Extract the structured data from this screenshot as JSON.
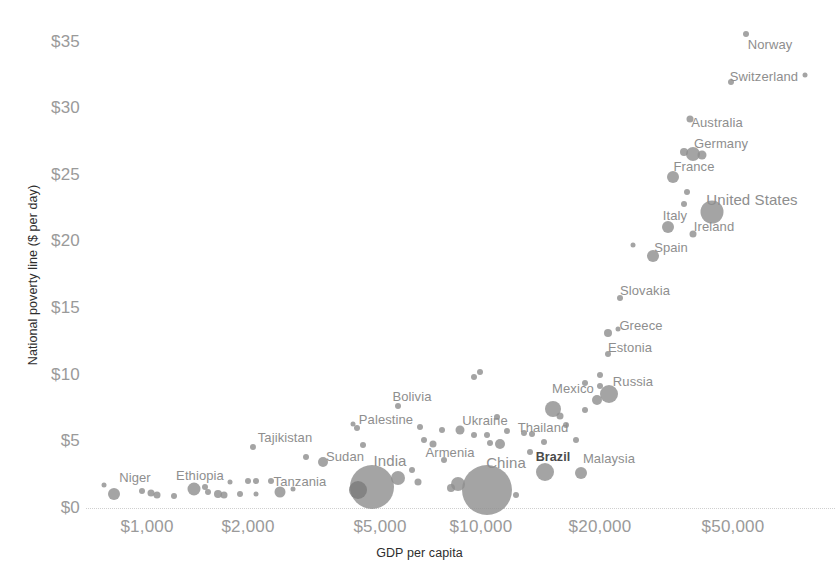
{
  "chart_data": {
    "type": "scatter",
    "title": "",
    "xlabel": "GDP per capita",
    "ylabel": "National poverty line ($ per day)",
    "xscale": "log",
    "yscale": "linear",
    "xlim": [
      700,
      70000
    ],
    "ylim": [
      0,
      36
    ],
    "grid": false,
    "legend": null,
    "xticks": [
      {
        "label": "$1,000",
        "value": 1000,
        "px": 147
      },
      {
        "label": "$2,000",
        "value": 2000,
        "px": 248
      },
      {
        "label": "$5,000",
        "value": 5000,
        "px": 380
      },
      {
        "label": "$10,000",
        "value": 10000,
        "px": 481
      },
      {
        "label": "$20,000",
        "value": 20000,
        "px": 600
      },
      {
        "label": "$50,000",
        "value": 50000,
        "px": 733
      }
    ],
    "yticks": [
      {
        "label": "$0",
        "value": 0,
        "px": 508
      },
      {
        "label": "$5",
        "value": 5,
        "px": 441
      },
      {
        "label": "$10",
        "value": 10,
        "px": 375
      },
      {
        "label": "$15",
        "value": 15,
        "px": 308
      },
      {
        "label": "$20",
        "value": 20,
        "px": 241
      },
      {
        "label": "$25",
        "value": 25,
        "px": 175
      },
      {
        "label": "$30",
        "value": 30,
        "px": 108
      },
      {
        "label": "$35",
        "value": 35,
        "px": 42
      }
    ],
    "bubble_color": "#8d8d8d",
    "points": [
      {
        "name": "",
        "x": 104,
        "y": 485,
        "r": 2.5,
        "label": null
      },
      {
        "name": "",
        "x": 114,
        "y": 494,
        "r": 6.0,
        "label": null
      },
      {
        "name": "Niger",
        "x": 142,
        "y": 491,
        "r": 3.0,
        "label": {
          "text": "Niger",
          "lx": 135,
          "ly": 477,
          "cls": "mid"
        }
      },
      {
        "name": "",
        "x": 151,
        "y": 493,
        "r": 3.5,
        "label": null
      },
      {
        "name": "",
        "x": 157,
        "y": 495,
        "r": 3.5,
        "label": null
      },
      {
        "name": "",
        "x": 174,
        "y": 496,
        "r": 3.0,
        "label": null
      },
      {
        "name": "Ethiopia",
        "x": 194,
        "y": 489,
        "r": 6.5,
        "label": {
          "text": "Ethiopia",
          "lx": 200,
          "ly": 475,
          "cls": "mid"
        }
      },
      {
        "name": "",
        "x": 205,
        "y": 487,
        "r": 3.0,
        "label": null
      },
      {
        "name": "",
        "x": 208,
        "y": 492,
        "r": 3.0,
        "label": null
      },
      {
        "name": "",
        "x": 218,
        "y": 494,
        "r": 4.0,
        "label": null
      },
      {
        "name": "",
        "x": 224,
        "y": 495,
        "r": 3.5,
        "label": null
      },
      {
        "name": "",
        "x": 230,
        "y": 482,
        "r": 2.5,
        "label": null
      },
      {
        "name": "",
        "x": 240,
        "y": 494,
        "r": 3.0,
        "label": null
      },
      {
        "name": "",
        "x": 248,
        "y": 481,
        "r": 3.0,
        "label": null
      },
      {
        "name": "",
        "x": 256,
        "y": 481,
        "r": 3.0,
        "label": null
      },
      {
        "name": "",
        "x": 256,
        "y": 494,
        "r": 2.5,
        "label": null
      },
      {
        "name": "",
        "x": 271,
        "y": 481,
        "r": 3.0,
        "label": null
      },
      {
        "name": "Tanzania",
        "x": 280,
        "y": 492,
        "r": 5.5,
        "label": {
          "text": "Tanzania",
          "lx": 300,
          "ly": 481,
          "cls": "mid"
        }
      },
      {
        "name": "",
        "x": 293,
        "y": 489,
        "r": 2.5,
        "label": null
      },
      {
        "name": "Tajikistan",
        "x": 253,
        "y": 447,
        "r": 3.0,
        "label": {
          "text": "Tajikistan",
          "lx": 285,
          "ly": 437,
          "cls": "mid"
        }
      },
      {
        "name": "",
        "x": 306,
        "y": 457,
        "r": 3.0,
        "label": null
      },
      {
        "name": "Sudan",
        "x": 323,
        "y": 462,
        "r": 5.0,
        "label": {
          "text": "Sudan",
          "lx": 345,
          "ly": 456,
          "cls": "mid"
        }
      },
      {
        "name": "Palestine",
        "x": 357,
        "y": 428,
        "r": 3.0,
        "label": {
          "text": "Palestine",
          "lx": 386,
          "ly": 419,
          "cls": "mid"
        }
      },
      {
        "name": "",
        "x": 353,
        "y": 424,
        "r": 2.5,
        "label": null
      },
      {
        "name": "",
        "x": 363,
        "y": 445,
        "r": 3.0,
        "label": null
      },
      {
        "name": "Bolivia",
        "x": 398,
        "y": 406,
        "r": 3.0,
        "label": {
          "text": "Bolivia",
          "lx": 412,
          "ly": 396,
          "cls": "mid"
        }
      },
      {
        "name": "India",
        "x": 372,
        "y": 487,
        "r": 22.0,
        "label": {
          "text": "India",
          "lx": 390,
          "ly": 460,
          "cls": "big"
        }
      },
      {
        "name": "",
        "x": 398,
        "y": 478,
        "r": 7.0,
        "label": null
      },
      {
        "name": "",
        "x": 358,
        "y": 490,
        "r": 9.0,
        "label": null,
        "dark": true
      },
      {
        "name": "",
        "x": 412,
        "y": 470,
        "r": 3.0,
        "label": null
      },
      {
        "name": "",
        "x": 418,
        "y": 482,
        "r": 3.5,
        "label": null
      },
      {
        "name": "Armenia",
        "x": 444,
        "y": 460,
        "r": 3.0,
        "label": {
          "text": "Armenia",
          "lx": 450,
          "ly": 452,
          "cls": "mid"
        }
      },
      {
        "name": "",
        "x": 424,
        "y": 440,
        "r": 3.0,
        "label": null
      },
      {
        "name": "",
        "x": 433,
        "y": 444,
        "r": 3.5,
        "label": null
      },
      {
        "name": "",
        "x": 442,
        "y": 430,
        "r": 3.0,
        "label": null
      },
      {
        "name": "",
        "x": 420,
        "y": 427,
        "r": 3.0,
        "label": null
      },
      {
        "name": "Ukraine",
        "x": 460,
        "y": 430,
        "r": 4.5,
        "label": {
          "text": "Ukraine",
          "lx": 485,
          "ly": 420,
          "cls": "mid"
        }
      },
      {
        "name": "",
        "x": 474,
        "y": 435,
        "r": 3.0,
        "label": null
      },
      {
        "name": "",
        "x": 487,
        "y": 435,
        "r": 3.0,
        "label": null
      },
      {
        "name": "",
        "x": 497,
        "y": 417,
        "r": 3.0,
        "label": null
      },
      {
        "name": "",
        "x": 507,
        "y": 431,
        "r": 3.0,
        "label": null
      },
      {
        "name": "China",
        "x": 487,
        "y": 490,
        "r": 25.0,
        "label": {
          "text": "China",
          "lx": 506,
          "ly": 462,
          "cls": "big"
        }
      },
      {
        "name": "",
        "x": 458,
        "y": 484,
        "r": 7.0,
        "label": null
      },
      {
        "name": "",
        "x": 451,
        "y": 488,
        "r": 4.0,
        "label": null
      },
      {
        "name": "",
        "x": 516,
        "y": 495,
        "r": 3.0,
        "label": null
      },
      {
        "name": "",
        "x": 500,
        "y": 444,
        "r": 5.0,
        "label": null
      },
      {
        "name": "",
        "x": 490,
        "y": 443,
        "r": 3.0,
        "label": null
      },
      {
        "name": "Thailand",
        "x": 530,
        "y": 452,
        "r": 3.0,
        "label": {
          "text": "Thailand",
          "lx": 543,
          "ly": 427,
          "cls": "mid"
        }
      },
      {
        "name": "",
        "x": 524,
        "y": 433,
        "r": 3.0,
        "label": null
      },
      {
        "name": "",
        "x": 532,
        "y": 434,
        "r": 3.0,
        "label": null
      },
      {
        "name": "",
        "x": 544,
        "y": 442,
        "r": 3.0,
        "label": null
      },
      {
        "name": "Brazil",
        "x": 545,
        "y": 472,
        "r": 9.0,
        "label": {
          "text": "Brazil",
          "lx": 553,
          "ly": 457,
          "cls": "bold"
        }
      },
      {
        "name": "Malaysia",
        "x": 581,
        "y": 473,
        "r": 6.0,
        "label": {
          "text": "Malaysia",
          "lx": 609,
          "ly": 458,
          "cls": "mid"
        }
      },
      {
        "name": "",
        "x": 576,
        "y": 440,
        "r": 3.0,
        "label": null
      },
      {
        "name": "",
        "x": 566,
        "y": 425,
        "r": 3.0,
        "label": null
      },
      {
        "name": "Mexico",
        "x": 553,
        "y": 409,
        "r": 8.0,
        "label": {
          "text": "Mexico",
          "lx": 573,
          "ly": 388,
          "cls": "mid"
        }
      },
      {
        "name": "",
        "x": 560,
        "y": 416,
        "r": 3.5,
        "label": null
      },
      {
        "name": "",
        "x": 585,
        "y": 383,
        "r": 3.0,
        "label": null
      },
      {
        "name": "",
        "x": 585,
        "y": 410,
        "r": 3.0,
        "label": null
      },
      {
        "name": "",
        "x": 600,
        "y": 375,
        "r": 3.0,
        "label": null
      },
      {
        "name": "",
        "x": 600,
        "y": 386,
        "r": 3.0,
        "label": null
      },
      {
        "name": "Russia",
        "x": 609,
        "y": 394,
        "r": 9.0,
        "label": {
          "text": "Russia",
          "lx": 633,
          "ly": 381,
          "cls": "mid"
        }
      },
      {
        "name": "",
        "x": 597,
        "y": 400,
        "r": 5.0,
        "label": null
      },
      {
        "name": "",
        "x": 474,
        "y": 377,
        "r": 3.0,
        "label": null
      },
      {
        "name": "",
        "x": 480,
        "y": 372,
        "r": 3.0,
        "label": null
      },
      {
        "name": "Estonia",
        "x": 608,
        "y": 354,
        "r": 3.0,
        "label": {
          "text": "Estonia",
          "lx": 630,
          "ly": 347,
          "cls": "mid"
        }
      },
      {
        "name": "Greece",
        "x": 608,
        "y": 333,
        "r": 4.0,
        "label": {
          "text": "Greece",
          "lx": 641,
          "ly": 325,
          "cls": "mid"
        }
      },
      {
        "name": "",
        "x": 618,
        "y": 329,
        "r": 2.5,
        "label": null
      },
      {
        "name": "Slovakia",
        "x": 620,
        "y": 298,
        "r": 3.0,
        "label": {
          "text": "Slovakia",
          "lx": 645,
          "ly": 290,
          "cls": "mid"
        }
      },
      {
        "name": "Spain",
        "x": 653,
        "y": 256,
        "r": 6.0,
        "label": {
          "text": "Spain",
          "lx": 671,
          "ly": 247,
          "cls": "mid"
        }
      },
      {
        "name": "",
        "x": 633,
        "y": 245,
        "r": 2.5,
        "label": null
      },
      {
        "name": "Italy",
        "x": 668,
        "y": 227,
        "r": 6.0,
        "label": {
          "text": "Italy",
          "lx": 675,
          "ly": 215,
          "cls": "mid"
        }
      },
      {
        "name": "Ireland",
        "x": 693,
        "y": 234,
        "r": 3.5,
        "label": {
          "text": "Ireland",
          "lx": 714,
          "ly": 226,
          "cls": "mid"
        }
      },
      {
        "name": "United States",
        "x": 712,
        "y": 212,
        "r": 11.5,
        "label": {
          "text": "United States",
          "lx": 752,
          "ly": 199,
          "cls": "big"
        }
      },
      {
        "name": "",
        "x": 684,
        "y": 204,
        "r": 3.0,
        "label": null
      },
      {
        "name": "",
        "x": 687,
        "y": 192,
        "r": 3.0,
        "label": null
      },
      {
        "name": "France",
        "x": 673,
        "y": 177,
        "r": 6.0,
        "label": {
          "text": "France",
          "lx": 694,
          "ly": 166,
          "cls": "mid"
        }
      },
      {
        "name": "Germany",
        "x": 693,
        "y": 154,
        "r": 7.0,
        "label": {
          "text": "Germany",
          "lx": 721,
          "ly": 143,
          "cls": "mid"
        }
      },
      {
        "name": "",
        "x": 702,
        "y": 155,
        "r": 4.5,
        "label": null
      },
      {
        "name": "",
        "x": 684,
        "y": 152,
        "r": 4.0,
        "label": null
      },
      {
        "name": "Australia",
        "x": 690,
        "y": 119,
        "r": 3.5,
        "label": {
          "text": "Australia",
          "lx": 717,
          "ly": 122,
          "cls": "mid"
        }
      },
      {
        "name": "Switzerland",
        "x": 731,
        "y": 82,
        "r": 3.0,
        "label": {
          "text": "Switzerland",
          "lx": 764,
          "ly": 76,
          "cls": "mid"
        }
      },
      {
        "name": "",
        "x": 805,
        "y": 75,
        "r": 2.5,
        "label": null
      },
      {
        "name": "Norway",
        "x": 746,
        "y": 34,
        "r": 3.0,
        "label": {
          "text": "Norway",
          "lx": 770,
          "ly": 44,
          "cls": "mid"
        }
      }
    ]
  }
}
